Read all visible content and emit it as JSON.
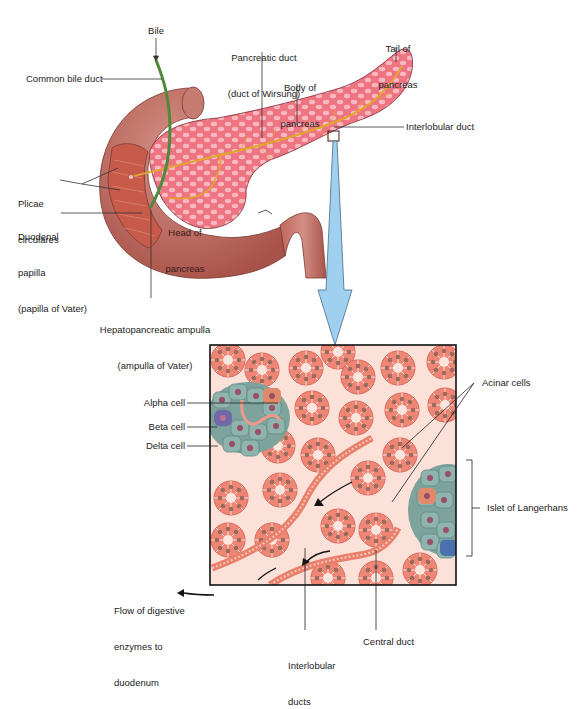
{
  "diagram": {
    "upper_labels": {
      "bile": "Bile",
      "common_bile_duct": "Common bile duct",
      "pancreatic_duct_1": "Pancreatic duct",
      "pancreatic_duct_2": "(duct of Wirsung)",
      "body_1": "Body of",
      "body_2": "pancreas",
      "tail_1": "Tail of",
      "tail_2": "pancreas",
      "interlobular_duct": "Interlobular duct",
      "plicae_1": "Plicae",
      "plicae_2": "circulares",
      "papilla_1": "Duodenal",
      "papilla_2": "papilla",
      "papilla_3": "(papilla of Vater)",
      "head_1": "Head of",
      "head_2": "pancreas",
      "ampulla_1": "Hepatopancreatic ampulla",
      "ampulla_2": "(ampulla of Vater)"
    },
    "lower_labels": {
      "alpha": "Alpha cell",
      "beta": "Beta cell",
      "delta": "Delta cell",
      "acinar": "Acinar cells",
      "islet": "Islet of Langerhans",
      "flow_1": "Flow of digestive",
      "flow_2": "enzymes to",
      "flow_3": "duodenum",
      "interlobular_1": "Interlobular",
      "interlobular_2": "ducts",
      "central_duct": "Central duct"
    },
    "colors": {
      "pancreas": "#f07a86",
      "lobule_highlight": "#f9c2c8",
      "duodenum": "#b8645c",
      "duodenum_light": "#d08a80",
      "bile_duct": "#4e8a3a",
      "pancreatic_duct": "#e0a830",
      "arrow_blue": "#9fd0f0",
      "tissue_bg": "#fbe1d8",
      "acinus": "#f08a7c",
      "islet_cell": "#8fb0aa",
      "nucleus": "#a65a6a"
    }
  }
}
